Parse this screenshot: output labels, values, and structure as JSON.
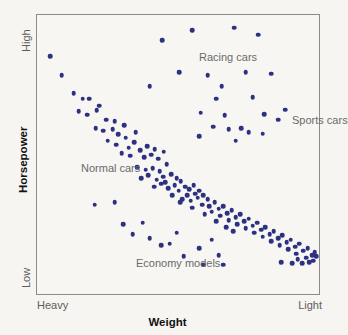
{
  "chart_data": {
    "type": "scatter",
    "title": "",
    "xlabel": "Weight",
    "ylabel": "Horsepower",
    "xlim": [
      0,
      100
    ],
    "ylim": [
      0,
      100
    ],
    "grid": false,
    "legend_position": "none",
    "x_tick_labels": [
      "Heavy",
      "Light"
    ],
    "y_tick_labels": [
      "Low",
      "High"
    ],
    "axis_direction_note": "x increases from Heavy (left) to Light (right); y increases from Low (bottom) to High (top)",
    "point_color": "#2d3182",
    "annotations": [
      {
        "text": "Racing cars",
        "x": 45.0,
        "y": 92.5
      },
      {
        "text": "Sports cars",
        "x": 78.0,
        "y": 70.5
      },
      {
        "text": "Normal cars",
        "x": 3.5,
        "y": 53.0
      },
      {
        "text": "Economy models",
        "x": 22.5,
        "y": 19.5
      }
    ],
    "series": [
      {
        "name": "Cars",
        "marker": "circle",
        "color": "#2d3182",
        "points": [
          [
            4.6,
            85.2
          ],
          [
            8.8,
            78.5
          ],
          [
            13.0,
            72.0
          ],
          [
            16.2,
            70.0
          ],
          [
            18.6,
            70.0
          ],
          [
            14.8,
            65.5
          ],
          [
            17.8,
            64.2
          ],
          [
            21.1,
            65.8
          ],
          [
            24.6,
            62.5
          ],
          [
            20.8,
            59.5
          ],
          [
            23.5,
            58.5
          ],
          [
            26.8,
            59.0
          ],
          [
            25.0,
            55.0
          ],
          [
            28.9,
            57.2
          ],
          [
            31.5,
            56.0
          ],
          [
            34.5,
            54.5
          ],
          [
            30.0,
            50.5
          ],
          [
            33.0,
            49.5
          ],
          [
            36.5,
            51.5
          ],
          [
            38.0,
            49.0
          ],
          [
            40.5,
            50.0
          ],
          [
            43.0,
            48.5
          ],
          [
            35.5,
            45.5
          ],
          [
            38.5,
            44.5
          ],
          [
            41.0,
            45.0
          ],
          [
            43.5,
            44.0
          ],
          [
            46.0,
            46.5
          ],
          [
            44.8,
            42.0
          ],
          [
            47.5,
            43.0
          ],
          [
            49.5,
            41.5
          ],
          [
            41.5,
            38.5
          ],
          [
            44.0,
            39.5
          ],
          [
            46.5,
            38.0
          ],
          [
            48.8,
            39.0
          ],
          [
            51.0,
            40.5
          ],
          [
            50.2,
            37.0
          ],
          [
            52.5,
            38.5
          ],
          [
            54.0,
            37.5
          ],
          [
            55.5,
            39.0
          ],
          [
            53.2,
            35.5
          ],
          [
            56.0,
            36.0
          ],
          [
            57.5,
            37.0
          ],
          [
            51.5,
            34.0
          ],
          [
            54.5,
            33.5
          ],
          [
            57.0,
            34.5
          ],
          [
            59.0,
            35.5
          ],
          [
            60.5,
            34.0
          ],
          [
            58.5,
            32.0
          ],
          [
            61.0,
            31.5
          ],
          [
            63.0,
            33.0
          ],
          [
            62.0,
            29.5
          ],
          [
            64.5,
            30.5
          ],
          [
            66.0,
            31.5
          ],
          [
            65.0,
            28.0
          ],
          [
            67.5,
            29.0
          ],
          [
            69.0,
            30.0
          ],
          [
            68.0,
            26.5
          ],
          [
            70.5,
            27.5
          ],
          [
            72.0,
            28.5
          ],
          [
            71.0,
            25.0
          ],
          [
            73.5,
            26.0
          ],
          [
            75.0,
            27.0
          ],
          [
            74.0,
            23.5
          ],
          [
            76.5,
            24.5
          ],
          [
            78.0,
            25.5
          ],
          [
            77.0,
            22.0
          ],
          [
            79.5,
            23.0
          ],
          [
            81.0,
            24.0
          ],
          [
            80.0,
            20.5
          ],
          [
            82.5,
            21.5
          ],
          [
            84.0,
            22.5
          ],
          [
            83.0,
            19.0
          ],
          [
            85.5,
            20.0
          ],
          [
            87.0,
            21.0
          ],
          [
            86.0,
            17.5
          ],
          [
            88.5,
            18.5
          ],
          [
            90.0,
            19.5
          ],
          [
            89.0,
            16.0
          ],
          [
            91.5,
            17.0
          ],
          [
            93.0,
            18.0
          ],
          [
            92.0,
            14.5
          ],
          [
            94.5,
            15.5
          ],
          [
            96.0,
            16.5
          ],
          [
            95.5,
            13.0
          ],
          [
            97.5,
            14.0
          ],
          [
            98.5,
            15.0
          ],
          [
            96.5,
            11.5
          ],
          [
            98.0,
            12.0
          ],
          [
            99.0,
            13.5
          ],
          [
            94.0,
            11.0
          ],
          [
            37.0,
            41.5
          ],
          [
            39.5,
            42.5
          ],
          [
            42.5,
            41.0
          ],
          [
            45.5,
            40.0
          ],
          [
            48.0,
            35.5
          ],
          [
            50.8,
            33.0
          ],
          [
            55.0,
            31.0
          ],
          [
            59.5,
            28.5
          ],
          [
            63.5,
            26.0
          ],
          [
            67.0,
            24.0
          ],
          [
            22.0,
            67.5
          ],
          [
            27.5,
            62.0
          ],
          [
            31.0,
            60.5
          ],
          [
            35.0,
            58.0
          ],
          [
            28.0,
            53.5
          ],
          [
            32.5,
            52.5
          ],
          [
            39.0,
            53.0
          ],
          [
            41.8,
            52.0
          ],
          [
            45.0,
            51.0
          ],
          [
            40.0,
            74.5
          ],
          [
            44.5,
            91.0
          ],
          [
            50.5,
            79.5
          ],
          [
            55.0,
            94.5
          ],
          [
            60.5,
            78.5
          ],
          [
            63.5,
            70.0
          ],
          [
            66.5,
            64.0
          ],
          [
            70.0,
            95.5
          ],
          [
            74.0,
            79.5
          ],
          [
            76.5,
            70.5
          ],
          [
            78.5,
            93.0
          ],
          [
            80.5,
            64.5
          ],
          [
            83.0,
            79.0
          ],
          [
            85.5,
            62.5
          ],
          [
            72.5,
            59.5
          ],
          [
            68.0,
            59.0
          ],
          [
            75.0,
            58.0
          ],
          [
            62.5,
            60.0
          ],
          [
            70.5,
            55.0
          ],
          [
            80.0,
            57.5
          ],
          [
            58.0,
            65.0
          ],
          [
            65.5,
            74.5
          ],
          [
            88.0,
            66.0
          ],
          [
            57.5,
            56.5
          ],
          [
            20.5,
            32.0
          ],
          [
            27.5,
            33.0
          ],
          [
            30.5,
            25.0
          ],
          [
            37.5,
            25.5
          ],
          [
            34.0,
            21.5
          ],
          [
            40.0,
            20.0
          ],
          [
            44.0,
            17.5
          ],
          [
            49.5,
            22.0
          ],
          [
            47.0,
            18.0
          ],
          [
            52.0,
            13.5
          ],
          [
            57.5,
            16.5
          ],
          [
            62.0,
            19.5
          ],
          [
            59.0,
            10.5
          ],
          [
            66.0,
            10.5
          ],
          [
            64.5,
            14.0
          ],
          [
            69.5,
            22.5
          ],
          [
            86.5,
            11.5
          ],
          [
            90.5,
            11.0
          ],
          [
            92.5,
            12.5
          ]
        ]
      }
    ]
  }
}
